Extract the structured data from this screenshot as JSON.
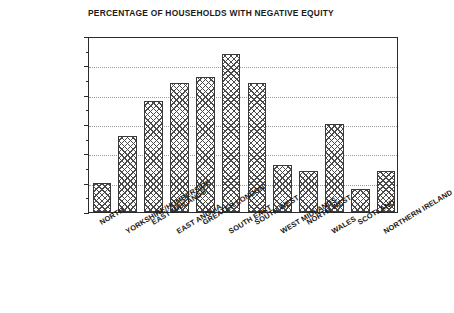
{
  "chart_data": {
    "type": "bar",
    "title": "PERCENTAGE OF HOUSEHOLDS WITH NEGATIVE EQUITY",
    "xlabel": "",
    "ylabel": "",
    "ylim": [
      0,
      30
    ],
    "yticks": [
      0,
      5,
      10,
      15,
      20,
      25,
      30
    ],
    "ytick_labels": [
      "0",
      "5",
      "10",
      "15",
      "20",
      "25",
      "30"
    ],
    "minor_ytick_interval": 2.5,
    "grid": "horizontal-dotted",
    "legend": "none",
    "bar_fill": "cross-hatch",
    "categories": [
      "NORTH",
      "YORKSHIRE/HUMBERSIDE",
      "EAST MIDLANDS",
      "EAST ANGLIA",
      "GREATER LONDON",
      "SOUTH EAST",
      "SOUTH WEST",
      "WEST MIDLANDS",
      "NORTH WEST",
      "WALES",
      "SCOTLAND",
      "NORTHERN IRELAND"
    ],
    "values": [
      5,
      13,
      19,
      22,
      23,
      27,
      22,
      8,
      7,
      15,
      4,
      7
    ]
  },
  "colors": {
    "frame": "#2b2b2b",
    "grid": "#9a9a9a",
    "bar_edge": "#3a3a3a",
    "hatch": "#4a4a4a",
    "text": "#1a1a1a",
    "background": "#ffffff"
  }
}
